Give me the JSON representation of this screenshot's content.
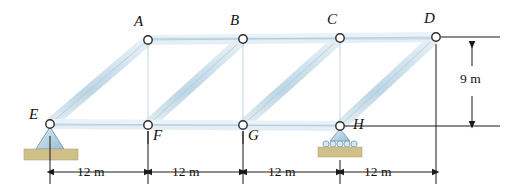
{
  "figure": {
    "type": "truss-diagram"
  },
  "nodes": [
    {
      "label": "A",
      "x": 148,
      "y": 40,
      "label_x": 134,
      "label_y": 18,
      "chord": "top"
    },
    {
      "label": "B",
      "x": 243,
      "y": 39,
      "label_x": 230,
      "label_y": 17,
      "chord": "top"
    },
    {
      "label": "C",
      "x": 340,
      "y": 38,
      "label_x": 327,
      "label_y": 16,
      "chord": "top"
    },
    {
      "label": "D",
      "x": 436,
      "y": 37,
      "label_x": 424,
      "label_y": 15,
      "chord": "top"
    },
    {
      "label": "E",
      "x": 50,
      "y": 124,
      "label_x": 30,
      "label_y": 108,
      "chord": "bottom"
    },
    {
      "label": "F",
      "x": 148,
      "y": 125,
      "label_x": 153,
      "label_y": 128,
      "chord": "bottom"
    },
    {
      "label": "G",
      "x": 243,
      "y": 125,
      "label_x": 248,
      "label_y": 128,
      "chord": "bottom"
    },
    {
      "label": "H",
      "x": 340,
      "y": 126,
      "label_x": 352,
      "label_y": 116,
      "chord": "bottom"
    }
  ],
  "members": [
    {
      "name": "top-chord-A-B",
      "from": "A",
      "to": "B",
      "kind": "chord"
    },
    {
      "name": "top-chord-B-C",
      "from": "B",
      "to": "C",
      "kind": "chord"
    },
    {
      "name": "top-chord-C-D",
      "from": "C",
      "to": "D",
      "kind": "chord"
    },
    {
      "name": "bottom-chord-E-F",
      "from": "E",
      "to": "F",
      "kind": "chord"
    },
    {
      "name": "bottom-chord-F-G",
      "from": "F",
      "to": "G",
      "kind": "chord"
    },
    {
      "name": "bottom-chord-G-H",
      "from": "G",
      "to": "H",
      "kind": "chord"
    },
    {
      "name": "vertical-A-F",
      "from": "A",
      "to": "F",
      "kind": "vertical"
    },
    {
      "name": "vertical-B-G",
      "from": "B",
      "to": "G",
      "kind": "vertical"
    },
    {
      "name": "vertical-C-H",
      "from": "C",
      "to": "H",
      "kind": "vertical"
    },
    {
      "name": "diagonal-E-A",
      "from": "E",
      "to": "A",
      "kind": "diagonal"
    },
    {
      "name": "diagonal-F-B",
      "from": "F",
      "to": "B",
      "kind": "diagonal"
    },
    {
      "name": "diagonal-G-C",
      "from": "G",
      "to": "C",
      "kind": "diagonal"
    },
    {
      "name": "diagonal-H-D",
      "from": "H",
      "to": "D",
      "kind": "diagonal"
    }
  ],
  "supports": [
    {
      "name": "pin-support-E",
      "node": "E",
      "type": "pin",
      "x": 50,
      "y": 124
    },
    {
      "name": "roller-support-H",
      "node": "H",
      "type": "roller",
      "x": 340,
      "y": 126
    }
  ],
  "dimensions": {
    "horizontal": {
      "spans": [
        {
          "label": "12 m",
          "from_x": 50,
          "to_x": 148,
          "text_x": 77,
          "text_y": 165
        },
        {
          "label": "12 m",
          "from_x": 148,
          "to_x": 243,
          "text_x": 172,
          "text_y": 165
        },
        {
          "label": "12 m",
          "from_x": 243,
          "to_x": 340,
          "text_x": 268,
          "text_y": 165
        },
        {
          "label": "12 m",
          "from_x": 340,
          "to_x": 436,
          "text_x": 364,
          "text_y": 165
        }
      ],
      "line_y": 172
    },
    "vertical": {
      "label": "9 m",
      "text_x": 462,
      "text_y": 74,
      "line_x": 472,
      "top_y": 38,
      "bottom_y": 125
    }
  },
  "colors": {
    "member_fill": "#cfe0ea",
    "member_fill_light": "#e6eff5",
    "member_edge": "#8fb2c6",
    "node_circle_fill": "#ffffff",
    "node_circle_edge": "#2b2b2b",
    "support_fill": "#bcd6e6",
    "support_edge": "#7aa0b8",
    "ground_fill": "#cfc08a",
    "dimension_line": "#1a1a1a",
    "label_text": "#111111",
    "background": "#ffffff"
  }
}
